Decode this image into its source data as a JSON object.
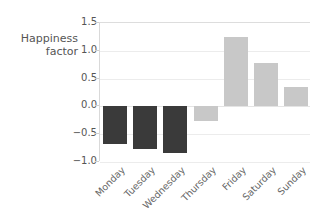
{
  "chart_data": {
    "type": "bar",
    "title": "",
    "xlabel": "",
    "ylabel": "Happiness\nfactor",
    "categories": [
      "Monday",
      "Tuesday",
      "Wednesday",
      "Thursday",
      "Friday",
      "Saturday",
      "Sunday"
    ],
    "values": [
      -0.68,
      -0.76,
      -0.83,
      -0.27,
      1.25,
      0.78,
      0.34
    ],
    "bar_colors": [
      "#3a3a3a",
      "#3a3a3a",
      "#3a3a3a",
      "#c8c8c8",
      "#c8c8c8",
      "#c8c8c8",
      "#c8c8c8"
    ],
    "ylim": [
      -1.0,
      1.5
    ],
    "yticks": [
      1.5,
      1.0,
      0.5,
      0.0,
      -0.5,
      -1.0
    ],
    "ytick_labels": [
      "1.5",
      "1.0",
      "0.5",
      "0.0",
      "-0.5",
      "-1.0"
    ],
    "grid": true,
    "legend": "none",
    "xtick_rotation": -45
  },
  "style": {
    "background": "#ffffff",
    "gridline_color": "#ececec",
    "axis_color": "#d9d9d9",
    "text_color": "#555555",
    "xlabel_color": "#666666",
    "dark_bar": "#3a3a3a",
    "light_bar": "#c8c8c8"
  }
}
